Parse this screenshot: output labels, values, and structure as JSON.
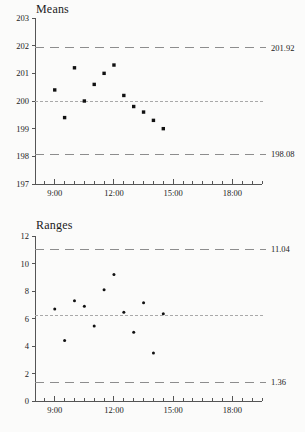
{
  "chart_data": [
    {
      "type": "scatter",
      "name": "means-chart",
      "title": "Means",
      "xlabel": "",
      "ylabel": "",
      "ylim": [
        197,
        203
      ],
      "ytick_labels": [
        "197",
        "198",
        "199",
        "200",
        "201",
        "202",
        "203"
      ],
      "ytick_values": [
        197,
        198,
        199,
        200,
        201,
        202,
        203
      ],
      "xlim_hours": [
        8.0,
        19.5
      ],
      "xtick_labels": [
        "9:00",
        "12:00",
        "15:00",
        "18:00"
      ],
      "xtick_hours": [
        9,
        12,
        15,
        18
      ],
      "minor_tick_interval_hours": 0.5,
      "grid": false,
      "legend": "none",
      "control_limits": {
        "ucl": 201.92,
        "ucl_label": "201.92",
        "lcl": 198.08,
        "lcl_label": "198.08",
        "center": 200.0
      },
      "x_hours": [
        9.0,
        9.5,
        10.0,
        10.5,
        11.0,
        11.5,
        12.0,
        12.5,
        13.0,
        13.5,
        14.0,
        14.5
      ],
      "values": [
        200.4,
        199.4,
        201.2,
        200.0,
        200.6,
        201.0,
        201.3,
        200.2,
        199.8,
        199.6,
        199.3,
        199.0
      ]
    },
    {
      "type": "scatter",
      "name": "ranges-chart",
      "title": "Ranges",
      "xlabel": "",
      "ylabel": "",
      "ylim": [
        0,
        12
      ],
      "ytick_labels": [
        "0",
        "2",
        "4",
        "6",
        "8",
        "10",
        "12"
      ],
      "ytick_values": [
        0,
        2,
        4,
        6,
        8,
        10,
        12
      ],
      "xlim_hours": [
        8.0,
        19.5
      ],
      "xtick_labels": [
        "9:00",
        "12:00",
        "15:00",
        "18:00"
      ],
      "xtick_hours": [
        9,
        12,
        15,
        18
      ],
      "minor_tick_interval_hours": 0.5,
      "grid": false,
      "legend": "none",
      "control_limits": {
        "ucl": 11.04,
        "ucl_label": "11.04",
        "lcl": 1.36,
        "lcl_label": "1.36",
        "center": 6.2
      },
      "x_hours": [
        9.0,
        9.5,
        10.0,
        10.5,
        11.0,
        11.5,
        12.0,
        12.5,
        13.0,
        13.5,
        14.0,
        14.5
      ],
      "values": [
        6.7,
        4.4,
        7.3,
        6.9,
        5.45,
        8.1,
        9.2,
        6.45,
        5.0,
        7.15,
        3.5,
        6.35
      ]
    }
  ]
}
